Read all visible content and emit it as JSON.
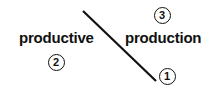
{
  "diagram": {
    "type": "annotated-line-diagram",
    "background_color": "#ffffff",
    "ink_color": "#111111",
    "words": [
      {
        "id": "productive",
        "text": "productive",
        "x": 19,
        "y": 30,
        "bold": true
      },
      {
        "id": "production",
        "text": "production",
        "x": 125,
        "y": 30,
        "bold": true
      }
    ],
    "markers": [
      {
        "id": "marker-1",
        "label": "1",
        "center_x": 167,
        "center_y": 76,
        "diameter": 17
      },
      {
        "id": "marker-2",
        "label": "2",
        "center_x": 56,
        "center_y": 62,
        "diameter": 17
      },
      {
        "id": "marker-3",
        "label": "3",
        "center_x": 162,
        "center_y": 15,
        "diameter": 17
      }
    ],
    "connector": {
      "id": "diagonal-stroke",
      "x1": 83,
      "y1": 11,
      "x2": 156,
      "y2": 81,
      "stroke_width": 2.2,
      "color": "#111111"
    }
  }
}
